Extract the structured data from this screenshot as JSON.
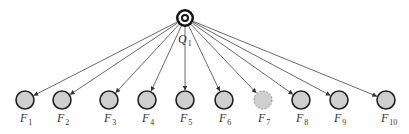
{
  "diagram": {
    "root": {
      "label": "Q",
      "subscript": "1",
      "x": 185,
      "y": 18
    },
    "children": [
      {
        "label": "F",
        "subscript": "1",
        "x": 25,
        "dashed": false
      },
      {
        "label": "F",
        "subscript": "2",
        "x": 62,
        "dashed": false
      },
      {
        "label": "F",
        "subscript": "3",
        "x": 109,
        "dashed": false
      },
      {
        "label": "F",
        "subscript": "4",
        "x": 147,
        "dashed": false
      },
      {
        "label": "F",
        "subscript": "5",
        "x": 185,
        "dashed": false
      },
      {
        "label": "F",
        "subscript": "6",
        "x": 224,
        "dashed": false
      },
      {
        "label": "F",
        "subscript": "7",
        "x": 263,
        "dashed": true
      },
      {
        "label": "F",
        "subscript": "8",
        "x": 301,
        "dashed": false
      },
      {
        "label": "F",
        "subscript": "9",
        "x": 339,
        "dashed": false
      },
      {
        "label": "F",
        "subscript": "10",
        "x": 386,
        "dashed": false
      }
    ],
    "child_y": 100,
    "child_radius": 9,
    "colors": {
      "node_fill": "#cfcfcf",
      "stroke": "#222222",
      "edge": "#444444"
    }
  }
}
